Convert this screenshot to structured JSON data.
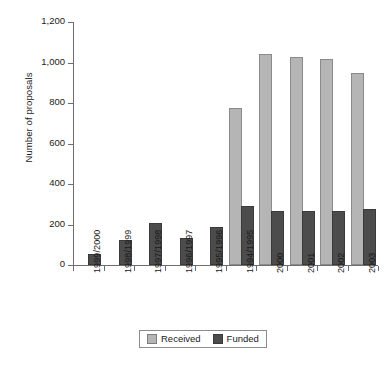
{
  "chart_data": {
    "type": "bar",
    "title": "",
    "xlabel": "",
    "ylabel": "Number of proposals",
    "ylim": [
      0,
      1200
    ],
    "yticks": [
      "0",
      "200",
      "400",
      "600",
      "800",
      "1,000",
      "1,200"
    ],
    "ytick_values": [
      0,
      200,
      400,
      600,
      800,
      1000,
      1200
    ],
    "grid": false,
    "legend_position": "bottom-center",
    "categories": [
      "1999/2000",
      "1998/1999",
      "1997/1998",
      "1996/1997",
      "1995/1996",
      "1994/1995",
      "2000",
      "2001",
      "2002",
      "2003"
    ],
    "series": [
      {
        "name": "Received",
        "color": "#b5b5b5",
        "values": [
          null,
          null,
          null,
          null,
          null,
          765,
          1032,
          1015,
          1008,
          940
        ]
      },
      {
        "name": "Funded",
        "color": "#4c4c4c",
        "values": [
          45,
          115,
          198,
          125,
          178,
          280,
          255,
          255,
          255,
          265
        ]
      }
    ]
  },
  "legend": {
    "items": [
      {
        "label": "Received",
        "swatch": "legend-swatch-received"
      },
      {
        "label": "Funded",
        "swatch": "legend-swatch-funded"
      }
    ]
  }
}
